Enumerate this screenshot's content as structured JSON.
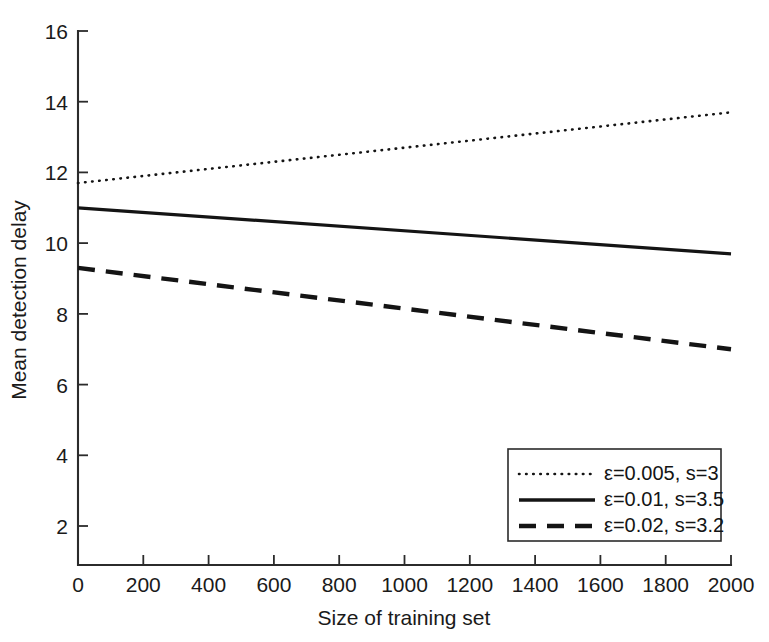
{
  "chart_data": {
    "type": "line",
    "title": "",
    "xlabel": "Size of training set",
    "ylabel": "Mean detection delay",
    "xlim": [
      0,
      2000
    ],
    "ylim": [
      0.9,
      16
    ],
    "xticks": [
      0,
      200,
      400,
      600,
      800,
      1000,
      1200,
      1400,
      1600,
      1800,
      2000
    ],
    "xtick_labels": [
      "0",
      "200",
      "400",
      "600",
      "800",
      "1000",
      "1200",
      "1400",
      "1600",
      "1800",
      "2000"
    ],
    "yticks": [
      2,
      4,
      6,
      8,
      10,
      12,
      14,
      16
    ],
    "ytick_labels": [
      "2",
      "4",
      "6",
      "8",
      "10",
      "12",
      "14",
      "16"
    ],
    "grid": false,
    "legend_position": "lower right",
    "x": [
      0,
      2000
    ],
    "series": [
      {
        "name": "ε=0.005, s=3",
        "style": "dotted",
        "color": "#141414",
        "values": [
          11.7,
          13.7
        ]
      },
      {
        "name": "ε=0.01, s=3.5",
        "style": "solid",
        "color": "#141414",
        "values": [
          11.0,
          9.7
        ]
      },
      {
        "name": "ε=0.02, s=3.2",
        "style": "dashed",
        "color": "#141414",
        "values": [
          9.3,
          7.0
        ]
      }
    ]
  },
  "axes": {
    "ylabel": "Mean detection delay",
    "xlabel": "Size of training set",
    "ytick_labels": [
      "16",
      "14",
      "12",
      "10",
      "8",
      "6",
      "4",
      "2"
    ],
    "xtick_labels": [
      "0",
      "200",
      "400",
      "600",
      "800",
      "1000",
      "1200",
      "1400",
      "1600",
      "1800",
      "2000"
    ]
  },
  "legend": {
    "entries": [
      {
        "label": "ε=0.005, s=3",
        "style": "dotted"
      },
      {
        "label": "ε=0.01, s=3.5",
        "style": "solid"
      },
      {
        "label": "ε=0.02, s=3.2",
        "style": "dashed"
      }
    ]
  }
}
